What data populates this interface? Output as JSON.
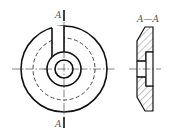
{
  "drawing": {
    "type": "engineering drawing - washer with slot",
    "front_view": {
      "section_label_top": "A",
      "section_label_bottom": "A"
    },
    "section_view": {
      "title": "A—A"
    }
  },
  "colors": {
    "line": "#111111",
    "label": "#555555",
    "background": "#ffffff"
  }
}
